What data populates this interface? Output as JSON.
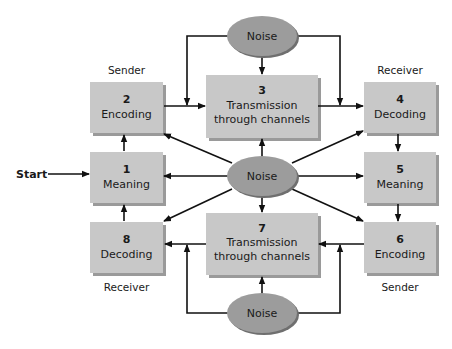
{
  "diagram": {
    "type": "communication-process-flow",
    "colors": {
      "box_fill": "#c8c8c8",
      "box_shadow": "#9a9a9a",
      "box_edge_light": "#d8d8d8",
      "noise_fill": "#9c9c9c",
      "noise_shadow": "#6f6f6f",
      "arrow": "#111111",
      "text": "#1a1a1a"
    },
    "start_label": "Start",
    "role_labels": {
      "top_left": "Sender",
      "top_right": "Receiver",
      "bottom_left": "Receiver",
      "bottom_right": "Sender"
    },
    "boxes": [
      {
        "id": "box-1",
        "number": "1",
        "label": "Meaning"
      },
      {
        "id": "box-2",
        "number": "2",
        "label": "Encoding"
      },
      {
        "id": "box-3",
        "number": "3",
        "label_line1": "Transmission",
        "label_line2": "through channels"
      },
      {
        "id": "box-4",
        "number": "4",
        "label": "Decoding"
      },
      {
        "id": "box-5",
        "number": "5",
        "label": "Meaning"
      },
      {
        "id": "box-6",
        "number": "6",
        "label": "Encoding"
      },
      {
        "id": "box-7",
        "number": "7",
        "label_line1": "Transmission",
        "label_line2": "through channels"
      },
      {
        "id": "box-8",
        "number": "8",
        "label": "Decoding"
      }
    ],
    "noise": {
      "top": "Noise",
      "center": "Noise",
      "bottom": "Noise"
    },
    "edges": [
      {
        "from": "start",
        "to": "box-1"
      },
      {
        "from": "box-1",
        "to": "box-2"
      },
      {
        "from": "box-2",
        "to": "box-3"
      },
      {
        "from": "box-3",
        "to": "box-4"
      },
      {
        "from": "box-4",
        "to": "box-5"
      },
      {
        "from": "box-5",
        "to": "box-6"
      },
      {
        "from": "box-6",
        "to": "box-7"
      },
      {
        "from": "box-7",
        "to": "box-8"
      },
      {
        "from": "box-8",
        "to": "box-1"
      },
      {
        "from": "noise-top",
        "to": "box-3"
      },
      {
        "from": "noise-top",
        "to": "edge-box2-box3"
      },
      {
        "from": "noise-top",
        "to": "edge-box3-box4"
      },
      {
        "from": "noise-bottom",
        "to": "box-7"
      },
      {
        "from": "noise-bottom",
        "to": "edge-box7-box8"
      },
      {
        "from": "noise-bottom",
        "to": "edge-box6-box7"
      },
      {
        "from": "noise-center",
        "to": "box-1"
      },
      {
        "from": "noise-center",
        "to": "box-2"
      },
      {
        "from": "noise-center",
        "to": "box-3"
      },
      {
        "from": "noise-center",
        "to": "box-4"
      },
      {
        "from": "noise-center",
        "to": "box-5"
      },
      {
        "from": "noise-center",
        "to": "box-6"
      },
      {
        "from": "noise-center",
        "to": "box-7"
      },
      {
        "from": "noise-center",
        "to": "box-8"
      }
    ]
  }
}
